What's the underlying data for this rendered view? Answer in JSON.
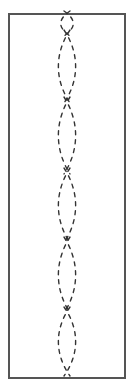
{
  "diagram": {
    "frame": {
      "x": 9,
      "y": 14,
      "width": 116,
      "height": 364,
      "stroke": "#555555",
      "stroke_width": 2
    },
    "chain": {
      "center_x": 67,
      "half_width": 12.5,
      "stroke": "#333333",
      "stroke_width": 1.4,
      "dash_pattern": "4 5",
      "nodes_y": [
        14,
        33,
        100,
        171,
        240,
        310,
        373
      ],
      "loop_count": 6
    },
    "colors": {
      "background": "#ffffff",
      "frame": "#555555",
      "dashes": "#333333"
    }
  }
}
